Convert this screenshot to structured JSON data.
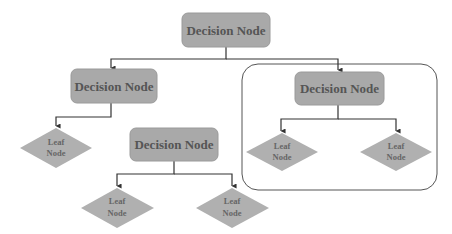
{
  "diagram": {
    "type": "decision-tree",
    "colors": {
      "node_fill": "#a9a9a9",
      "node_stroke": "#9a9a9a",
      "node_text": "#555555",
      "leaf_fill": "#b0b0b0",
      "leaf_text": "#666666",
      "edge": "#333333",
      "container_stroke": "#555555",
      "background": "#ffffff"
    },
    "nodes": {
      "root": {
        "label": "Decision Node"
      },
      "left": {
        "label": "Decision Node"
      },
      "middle": {
        "label": "Decision Node"
      },
      "right": {
        "label": "Decision Node"
      }
    },
    "leaves": [
      {
        "line1": "Leaf",
        "line2": "Node"
      },
      {
        "line1": "Leaf",
        "line2": "Node"
      },
      {
        "line1": "Leaf",
        "line2": "Node"
      },
      {
        "line1": "Leaf",
        "line2": "Node"
      },
      {
        "line1": "Leaf",
        "line2": "Node"
      }
    ],
    "edges": [
      {
        "from": "root",
        "to": "left"
      },
      {
        "from": "root",
        "to": "right"
      },
      {
        "from": "left",
        "to": "leaf-1"
      },
      {
        "from": "middle",
        "to": "leaf-2"
      },
      {
        "from": "middle",
        "to": "leaf-3"
      },
      {
        "from": "right",
        "to": "leaf-4"
      },
      {
        "from": "right",
        "to": "leaf-5"
      }
    ],
    "highlight": "right subtree enclosed in rounded rectangle"
  }
}
